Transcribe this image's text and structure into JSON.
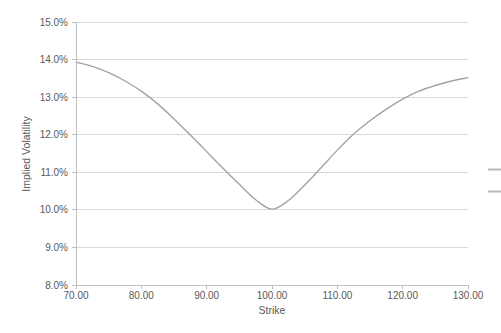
{
  "colors": {
    "background": "#ffffff",
    "text": "#595959",
    "gridline": "#d9d9d9",
    "axis": "#bfbfbf",
    "series_line": "#a3a3a3",
    "legend_sample": "#b8b8b8"
  },
  "chart_data": {
    "type": "line",
    "title": "",
    "xlabel": "Strike",
    "ylabel": "Implied Volatility",
    "y_unit": "%",
    "xlim": [
      70,
      130
    ],
    "ylim": [
      8,
      15
    ],
    "grid": "horizontal-only",
    "legend_position": "right (cropped at image edge)",
    "x_ticks": [
      {
        "value": 70,
        "label": "70.00"
      },
      {
        "value": 80,
        "label": "80.00"
      },
      {
        "value": 90,
        "label": "90.00"
      },
      {
        "value": 100,
        "label": "100.00"
      },
      {
        "value": 110,
        "label": "110.00"
      },
      {
        "value": 120,
        "label": "120.00"
      },
      {
        "value": 130,
        "label": "130.00"
      }
    ],
    "y_ticks": [
      {
        "value": 8,
        "label": "8.0%"
      },
      {
        "value": 9,
        "label": "9.0%"
      },
      {
        "value": 10,
        "label": "10.0%"
      },
      {
        "value": 11,
        "label": "11.0%"
      },
      {
        "value": 12,
        "label": "12.0%"
      },
      {
        "value": 13,
        "label": "13.0%"
      },
      {
        "value": 14,
        "label": "14.0%"
      },
      {
        "value": 15,
        "label": "15.0%"
      }
    ],
    "series": [
      {
        "name": "implied-volatility-smile",
        "color": "#a3a3a3",
        "x": [
          70,
          72.5,
          75,
          77.5,
          80,
          82.5,
          85,
          87.5,
          90,
          92.5,
          95,
          97.5,
          100,
          102.5,
          105,
          107.5,
          110,
          112.5,
          115,
          117.5,
          120,
          122.5,
          125,
          127.5,
          130
        ],
        "y": [
          13.93,
          13.82,
          13.65,
          13.43,
          13.16,
          12.82,
          12.42,
          11.99,
          11.55,
          11.11,
          10.68,
          10.27,
          10.02,
          10.25,
          10.66,
          11.12,
          11.59,
          12.02,
          12.37,
          12.68,
          12.95,
          13.16,
          13.31,
          13.43,
          13.52
        ]
      }
    ]
  },
  "legend": {
    "cropped_line_samples": [
      {
        "color": "#b8b8b8"
      },
      {
        "color": "#b8b8b8"
      }
    ]
  }
}
